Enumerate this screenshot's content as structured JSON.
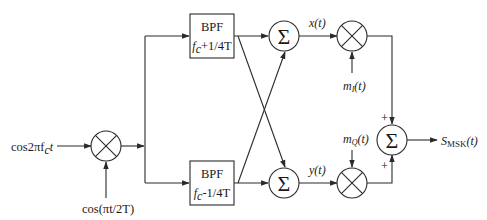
{
  "diagram": {
    "type": "block-diagram",
    "inputs": {
      "carrier": "cos2πf",
      "carrier_sub": "c",
      "carrier_t": "t",
      "modulating": "cos(πt/2T)"
    },
    "blocks": {
      "bpf_top": {
        "label": "BPF",
        "f": "f",
        "f_sub": "c",
        "f_rest": "+1/4T"
      },
      "bpf_bottom": {
        "label": "BPF",
        "f": "f",
        "f_sub": "c",
        "f_rest": "-1/4T"
      },
      "sum_symbol": "Σ"
    },
    "signals": {
      "x": "x(t)",
      "y": "y(t)",
      "mI": "m",
      "mI_sub": "I",
      "mI_arg": "(t)",
      "mQ": "m",
      "mQ_sub": "Q",
      "mQ_arg": "(t)",
      "plus_top": "+",
      "plus_bottom": "+",
      "output": "S",
      "output_sub": "MSK",
      "output_arg": "(t)"
    },
    "colors": {
      "line": "#2a2a2a",
      "text": "#1a1a1a",
      "background": "#ffffff"
    }
  }
}
